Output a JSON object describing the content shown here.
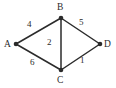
{
  "diagram": {
    "type": "weighted-undirected-graph",
    "background_color": "#ffffff",
    "edge_color": "#2b2b2b",
    "node_color": "#2b2b2b",
    "label_color": "#2b2b2b",
    "nodes": [
      {
        "id": "A",
        "label": "A",
        "x": 16,
        "y": 44
      },
      {
        "id": "B",
        "label": "B",
        "x": 61,
        "y": 18
      },
      {
        "id": "C",
        "label": "C",
        "x": 61,
        "y": 70
      },
      {
        "id": "D",
        "label": "D",
        "x": 100,
        "y": 44
      }
    ],
    "edges": [
      {
        "id": "AB",
        "from": "A",
        "to": "B",
        "weight": "4"
      },
      {
        "id": "BD",
        "from": "B",
        "to": "D",
        "weight": "5"
      },
      {
        "id": "BC",
        "from": "B",
        "to": "C",
        "weight": "2"
      },
      {
        "id": "AC",
        "from": "A",
        "to": "C",
        "weight": "6"
      },
      {
        "id": "CD",
        "from": "C",
        "to": "D",
        "weight": "1"
      }
    ]
  }
}
